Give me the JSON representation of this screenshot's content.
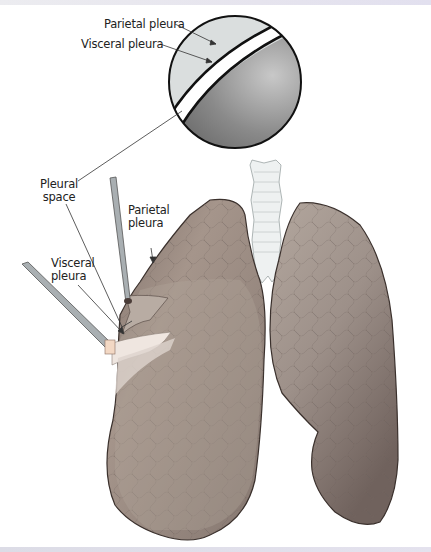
{
  "figure": {
    "type": "anatomical illustration",
    "inset": {
      "description": "Magnified cross-section of pleural layers",
      "labels": [
        {
          "id": "inset-parietal",
          "text": "Parietal pleura"
        },
        {
          "id": "inset-visceral",
          "text": "Visceral pleura"
        }
      ]
    },
    "labels": [
      {
        "id": "pleural-space",
        "line1": "Pleural",
        "line2": "space"
      },
      {
        "id": "parietal-pleura",
        "line1": "Parietal",
        "line2": "pleura"
      },
      {
        "id": "visceral-pleura",
        "line1": "Visceral",
        "line2": "pleura"
      }
    ],
    "colors": {
      "lung": "#8f8078",
      "lung_light": "#b9aca3",
      "lung_outline": "#3a302c",
      "trachea": "#e8ecec",
      "inset_outer": "#d8dcdc",
      "inset_inner": "#7a7a7a",
      "retractor": "#9aa0a4"
    }
  }
}
